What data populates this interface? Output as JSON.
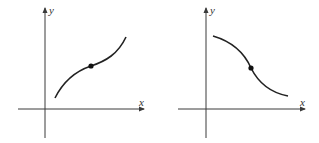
{
  "graphs": [
    {
      "name": "increasing-curve-graph",
      "x_label": "x",
      "y_label": "y",
      "description": "Increasing curve, concave down then concave up, with inflection point marked"
    },
    {
      "name": "decreasing-curve-graph",
      "x_label": "x",
      "y_label": "y",
      "description": "Decreasing curve, concave down then concave up, with inflection point marked"
    }
  ],
  "colors": {
    "axis": "#3a3a3a",
    "curve": "#222222",
    "background": "#ffffff"
  }
}
